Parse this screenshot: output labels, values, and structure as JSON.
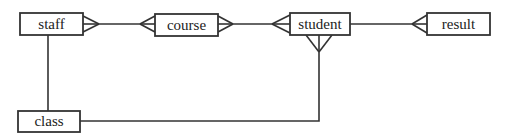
{
  "diagram": {
    "type": "entity-relationship",
    "notation": "crow's foot",
    "colors": {
      "line": "#333333",
      "box_fill": "#ffffff",
      "text": "#222222",
      "background": "#ffffff"
    },
    "entities": [
      {
        "id": "staff",
        "label": "staff"
      },
      {
        "id": "course",
        "label": "course"
      },
      {
        "id": "student",
        "label": "student"
      },
      {
        "id": "result",
        "label": "result"
      },
      {
        "id": "class",
        "label": "class"
      }
    ],
    "relationships": [
      {
        "from": "staff",
        "to": "course",
        "from_cardinality": "many",
        "to_cardinality": "many"
      },
      {
        "from": "course",
        "to": "student",
        "from_cardinality": "many",
        "to_cardinality": "many"
      },
      {
        "from": "student",
        "to": "result",
        "from_cardinality": "one",
        "to_cardinality": "many"
      },
      {
        "from": "staff",
        "to": "class",
        "from_cardinality": "one",
        "to_cardinality": "one"
      },
      {
        "from": "class",
        "to": "student",
        "from_cardinality": "one",
        "to_cardinality": "many"
      }
    ]
  }
}
